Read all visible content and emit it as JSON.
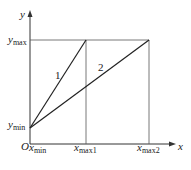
{
  "diagram": {
    "type": "line-graph",
    "axes": {
      "x_label": "x",
      "y_label": "y",
      "origin_label": "O"
    },
    "y_ticks": [
      {
        "base": "y",
        "sub": "max"
      },
      {
        "base": "y",
        "sub": "min"
      }
    ],
    "x_ticks": [
      {
        "base": "x",
        "sub": "min"
      },
      {
        "base": "x",
        "sub": "max1"
      },
      {
        "base": "x",
        "sub": "max2"
      }
    ],
    "lines": [
      {
        "label": "1",
        "from": "(x_min, y_min)",
        "to": "(x_max1, y_max)"
      },
      {
        "label": "2",
        "from": "(x_min, y_min)",
        "to": "(x_max2, y_max)"
      }
    ],
    "caption": ""
  }
}
